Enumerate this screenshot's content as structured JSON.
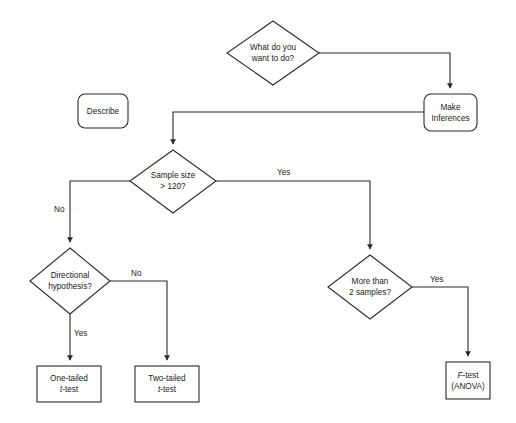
{
  "diagram": {
    "type": "flowchart",
    "stroke_color": "#2b2b2b",
    "text_color": "#1a1a1a",
    "background_color": "#ffffff"
  },
  "nodes": {
    "start": {
      "shape": "diamond",
      "line1": "What do you",
      "line2": "want to do?"
    },
    "describe": {
      "shape": "rounded-rect",
      "line1": "Describe"
    },
    "make_inferences": {
      "shape": "rounded-rect",
      "line1": "Make",
      "line2": "Inferences"
    },
    "sample_size": {
      "shape": "diamond",
      "line1": "Sample size",
      "line2": "> 120?"
    },
    "directional": {
      "shape": "diamond",
      "line1": "Directional",
      "line2": "hypothesis?"
    },
    "more_samples": {
      "shape": "diamond",
      "line1": "More than",
      "line2": "2 samples?"
    },
    "one_tailed": {
      "shape": "rect",
      "line1": "One-tailed",
      "line2_italic": "t",
      "line2_rest": "-test"
    },
    "two_tailed": {
      "shape": "rect",
      "line1": "Two-tailed",
      "line2_italic": "t",
      "line2_rest": "-test"
    },
    "f_test": {
      "shape": "rect",
      "line1_italic": "F",
      "line1_rest": "-test",
      "line2": "(ANOVA)"
    }
  },
  "edges": {
    "sample_size_yes": "Yes",
    "sample_size_no": "No",
    "directional_no": "No",
    "directional_yes": "Yes",
    "more_samples_yes": "Yes"
  }
}
